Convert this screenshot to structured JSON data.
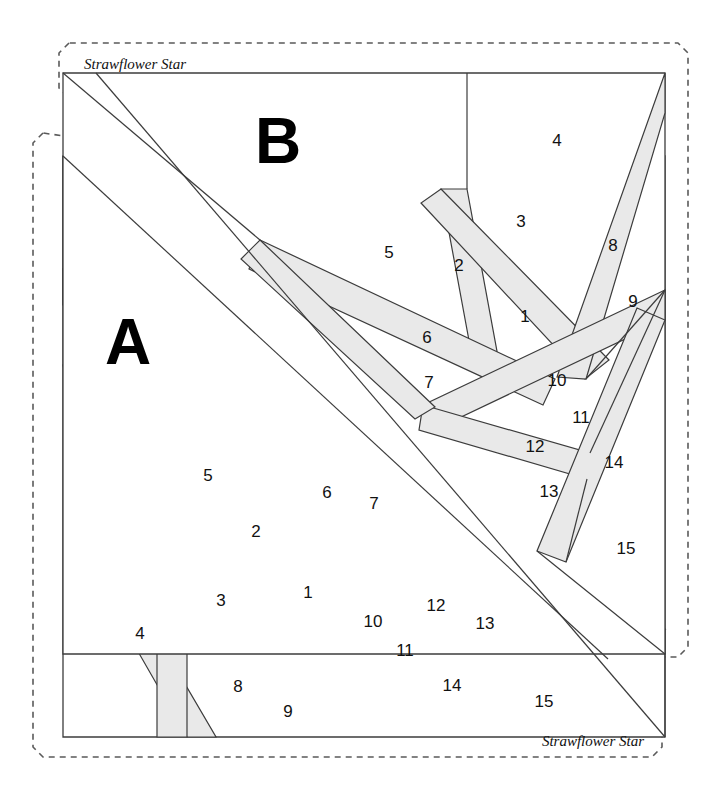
{
  "document": {
    "title": "Strawflower Star",
    "sheet_width": 727,
    "sheet_height": 800,
    "background_color": "#ffffff",
    "line_color": "#3c3c3c",
    "strip_fill_color": "#e9e9e9",
    "cut_line_color": "#5a5a5a"
  },
  "blocks": [
    {
      "id": "block-b",
      "letter": "B",
      "pattern_name": "Strawflower Star",
      "name_position": "top-left",
      "letter_x": 278,
      "letter_y": 146,
      "name_x": 84,
      "name_y": 69,
      "rotation": 0,
      "piece_numbers": [
        "1",
        "2",
        "3",
        "4",
        "5",
        "6",
        "7",
        "8",
        "9",
        "10",
        "11",
        "12",
        "13",
        "14",
        "15"
      ],
      "labels": [
        {
          "n": "1",
          "x": 525,
          "y": 318
        },
        {
          "n": "2",
          "x": 459,
          "y": 267
        },
        {
          "n": "3",
          "x": 521,
          "y": 223
        },
        {
          "n": "4",
          "x": 557,
          "y": 142
        },
        {
          "n": "5",
          "x": 389,
          "y": 254
        },
        {
          "n": "6",
          "x": 427,
          "y": 339
        },
        {
          "n": "7",
          "x": 429,
          "y": 384
        },
        {
          "n": "8",
          "x": 613,
          "y": 247
        },
        {
          "n": "9",
          "x": 633,
          "y": 303
        },
        {
          "n": "10",
          "x": 557,
          "y": 382
        },
        {
          "n": "11",
          "x": 581,
          "y": 419
        },
        {
          "n": "12",
          "x": 535,
          "y": 448
        },
        {
          "n": "13",
          "x": 549,
          "y": 493
        },
        {
          "n": "14",
          "x": 614,
          "y": 464
        },
        {
          "n": "15",
          "x": 626,
          "y": 550
        }
      ]
    },
    {
      "id": "block-a",
      "letter": "A",
      "pattern_name": "Strawflower Star",
      "name_position": "bottom-right",
      "letter_x": 128,
      "letter_y": 347,
      "name_x": 644,
      "name_y": 745,
      "rotation": 180,
      "piece_numbers": [
        "1",
        "2",
        "3",
        "4",
        "5",
        "6",
        "7",
        "8",
        "9",
        "10",
        "11",
        "12",
        "13",
        "14",
        "15"
      ],
      "labels": [
        {
          "n": "1",
          "x": 308,
          "y": 594
        },
        {
          "n": "2",
          "x": 256,
          "y": 533
        },
        {
          "n": "3",
          "x": 221,
          "y": 602
        },
        {
          "n": "4",
          "x": 140,
          "y": 635
        },
        {
          "n": "5",
          "x": 208,
          "y": 477
        },
        {
          "n": "6",
          "x": 327,
          "y": 494
        },
        {
          "n": "7",
          "x": 374,
          "y": 505
        },
        {
          "n": "8",
          "x": 238,
          "y": 688
        },
        {
          "n": "9",
          "x": 288,
          "y": 713
        },
        {
          "n": "10",
          "x": 373,
          "y": 623
        },
        {
          "n": "11",
          "x": 405,
          "y": 652
        },
        {
          "n": "12",
          "x": 436,
          "y": 607
        },
        {
          "n": "13",
          "x": 485,
          "y": 625
        },
        {
          "n": "14",
          "x": 452,
          "y": 687
        },
        {
          "n": "15",
          "x": 544,
          "y": 703
        }
      ]
    }
  ],
  "legend": {
    "letter_a": "A",
    "letter_b": "B",
    "name_top": "Strawflower Star",
    "name_bottom": "Strawflower Star"
  }
}
